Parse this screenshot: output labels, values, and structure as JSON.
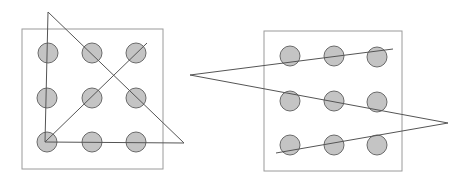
{
  "diagram": {
    "colors": {
      "dot_fill": "#c4c4c4",
      "dot_stroke": "#6a6a6a",
      "line": "#555555",
      "box": "#9a9a9a"
    },
    "panels": [
      {
        "name": "triangle-solution",
        "box": {
          "x": 22,
          "y": 29,
          "w": 141,
          "h": 140
        },
        "dots": [
          [
            48,
            53
          ],
          [
            92,
            53
          ],
          [
            136,
            53
          ],
          [
            47,
            98
          ],
          [
            92,
            98
          ],
          [
            136,
            98
          ],
          [
            47,
            142
          ],
          [
            92,
            142
          ],
          [
            136,
            142
          ]
        ],
        "path": "48,12 45,142 184,143 48,12",
        "extra_line": "45,142 147,43"
      },
      {
        "name": "zigzag-solution",
        "box": {
          "x": 264,
          "y": 31,
          "w": 138,
          "h": 140
        },
        "dots": [
          [
            290,
            56
          ],
          [
            334,
            56
          ],
          [
            377,
            57
          ],
          [
            290,
            101
          ],
          [
            334,
            101
          ],
          [
            377,
            102
          ],
          [
            290,
            145
          ],
          [
            334,
            145
          ],
          [
            377,
            145
          ]
        ],
        "path": "393,49 190,75 448,123 276,153"
      }
    ]
  }
}
